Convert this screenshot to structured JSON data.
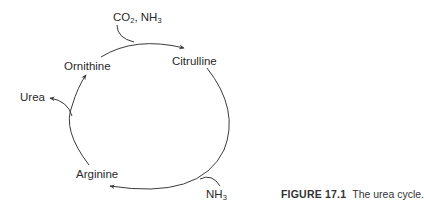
{
  "figure": {
    "title": "The urea cycle",
    "caption": {
      "figure_number": "FIGURE 17.1",
      "text": "The urea cycle."
    }
  },
  "nodes": {
    "ornithine": "Ornithine",
    "citrulline": "Citrulline",
    "arginine": "Arginine",
    "urea": "Urea"
  },
  "inputs": {
    "co2_nh3": {
      "base1": "CO",
      "sub1": "2",
      "sep": ", NH",
      "sub2": "3"
    },
    "nh3": {
      "base": "NH",
      "sub": "3"
    }
  },
  "edges": [
    {
      "from": "Ornithine",
      "to": "Citrulline",
      "input": "CO2, NH3"
    },
    {
      "from": "Citrulline",
      "to": "Arginine",
      "input": "NH3"
    },
    {
      "from": "Arginine",
      "to": "Ornithine",
      "output": "Urea"
    }
  ],
  "colors": {
    "line": "#3a3a3a",
    "text": "#2a2a2a",
    "background": "#ffffff"
  }
}
